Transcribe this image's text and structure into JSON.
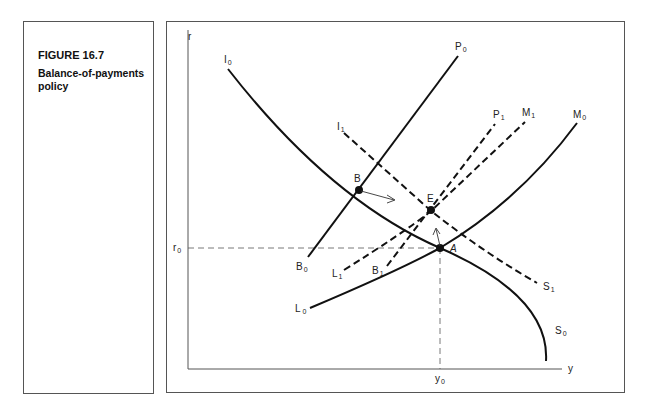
{
  "caption": {
    "figure_number": "FIGURE 16.7",
    "title": "Balance-of-payments policy"
  },
  "axes": {
    "y_label": "r",
    "x_label": "y",
    "r0_label": "r",
    "r0_sub": "0",
    "y0_label": "y",
    "y0_sub": "0"
  },
  "curves": [
    {
      "name": "I0-S0",
      "style": "solid",
      "start_label": "I",
      "start_sub": "0",
      "end_label": "S",
      "end_sub": "0"
    },
    {
      "name": "I1-S1",
      "style": "dashed",
      "start_label": "I",
      "start_sub": "1",
      "end_label": "S",
      "end_sub": "1"
    },
    {
      "name": "B0-P0",
      "style": "solid",
      "start_label": "B",
      "start_sub": "0",
      "end_label": "P",
      "end_sub": "0"
    },
    {
      "name": "B1-P1",
      "style": "dashed",
      "start_label": "B",
      "start_sub": "1",
      "end_label": "P",
      "end_sub": "1"
    },
    {
      "name": "L0-M0",
      "style": "solid",
      "start_label": "L",
      "start_sub": "0",
      "end_label": "M",
      "end_sub": "0"
    },
    {
      "name": "L1-M1",
      "style": "dashed",
      "start_label": "L",
      "start_sub": "1",
      "end_label": "M",
      "end_sub": "1"
    }
  ],
  "points": [
    {
      "label": "A",
      "desc": "initial equilibrium at r0, y0"
    },
    {
      "label": "B",
      "desc": "intersection of I0S0 and B0P0"
    },
    {
      "label": "E",
      "desc": "new equilibrium"
    }
  ]
}
